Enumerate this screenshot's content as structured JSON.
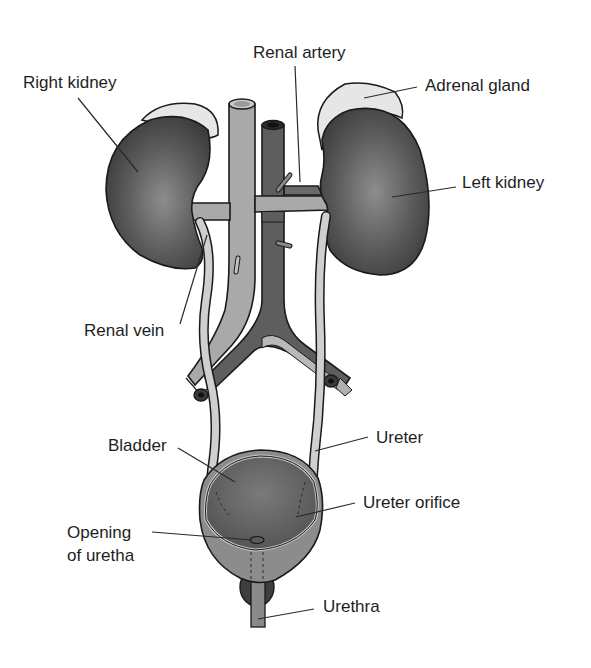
{
  "diagram": {
    "labels": {
      "right_kidney": "Right kidney",
      "renal_artery": "Renal artery",
      "adrenal_gland": "Adrenal gland",
      "left_kidney": "Left kidney",
      "renal_vein": "Renal vein",
      "bladder": "Bladder",
      "ureter": "Ureter",
      "ureter_orifice": "Ureter orifice",
      "opening_line1": "Opening",
      "opening_line2": "of uretha",
      "urethra": "Urethra"
    },
    "colors": {
      "kidney_dark": "#4a4a4a",
      "kidney_center": "#8a8a8a",
      "adrenal": "#e6e6e6",
      "vein_light": "#a9a9a9",
      "artery_dark": "#5e5e5e",
      "ureter": "#c9c9c9",
      "bladder_outer": "#8c8c8c",
      "bladder_inner": "#5f5f5f",
      "outline": "#1a1a1a"
    }
  }
}
